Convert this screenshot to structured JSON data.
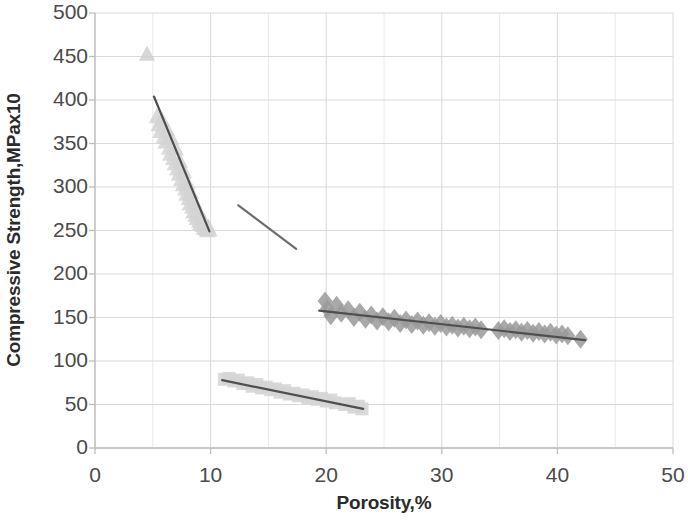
{
  "chart_data": {
    "type": "scatter",
    "title": "",
    "xlabel": "Porosity,%",
    "ylabel": "Compressive Strength,MPax10",
    "xlim": [
      0,
      50
    ],
    "ylim": [
      0,
      500
    ],
    "xticks": [
      "0",
      "10",
      "20",
      "30",
      "40",
      "50"
    ],
    "yticks": [
      "500",
      "450",
      "400",
      "350",
      "300",
      "250",
      "200",
      "150",
      "100",
      "50",
      "0"
    ],
    "xtick_values": [
      0,
      10,
      20,
      30,
      40,
      50
    ],
    "ytick_values": [
      500,
      450,
      400,
      350,
      300,
      250,
      200,
      150,
      100,
      50,
      0
    ],
    "grid": true,
    "minor_grid_x_step": 5,
    "legend": "none",
    "colors": {
      "marker_light": "#d2d2d2",
      "marker_mid": "#9a9a9a",
      "trendline_dark": "#4f4f4f",
      "trendline_mid": "#6e6e6e",
      "gridline": "#d9d9d9",
      "minor_gridline": "#eaeaea",
      "axis": "#bdbdbd",
      "tick_text": "#4a4a4a",
      "title_text": "#2b2b2b"
    },
    "series": [
      {
        "name": "isolated-triangle-point",
        "marker": "triangle",
        "color": "#cfcfcf",
        "points": [
          [
            4.5,
            453
          ]
        ]
      },
      {
        "name": "triangles-high-strength",
        "marker": "triangle",
        "color": "#d4d4d4",
        "trendline": {
          "x0": 5.1,
          "y0": 404,
          "x1": 9.9,
          "y1": 249,
          "color": "#4f4f4f"
        },
        "points": [
          [
            5.35,
            381
          ],
          [
            5.5,
            372
          ],
          [
            5.65,
            364
          ],
          [
            5.8,
            377
          ],
          [
            5.95,
            358
          ],
          [
            6.1,
            352
          ],
          [
            6.25,
            366
          ],
          [
            6.4,
            345
          ],
          [
            6.5,
            338
          ],
          [
            6.6,
            356
          ],
          [
            6.75,
            333
          ],
          [
            6.9,
            327
          ],
          [
            7.0,
            344
          ],
          [
            7.1,
            321
          ],
          [
            7.25,
            315
          ],
          [
            7.35,
            330
          ],
          [
            7.45,
            309
          ],
          [
            7.6,
            303
          ],
          [
            7.7,
            318
          ],
          [
            7.8,
            298
          ],
          [
            7.9,
            292
          ],
          [
            8.0,
            305
          ],
          [
            8.1,
            287
          ],
          [
            8.2,
            281
          ],
          [
            8.3,
            294
          ],
          [
            8.4,
            277
          ],
          [
            8.5,
            272
          ],
          [
            8.6,
            283
          ],
          [
            8.7,
            268
          ],
          [
            8.8,
            264
          ],
          [
            8.9,
            274
          ],
          [
            9.0,
            261
          ],
          [
            9.1,
            258
          ],
          [
            9.2,
            266
          ],
          [
            9.3,
            256
          ],
          [
            9.4,
            253
          ],
          [
            9.5,
            259
          ],
          [
            9.6,
            252
          ],
          [
            9.7,
            250
          ],
          [
            9.8,
            254
          ],
          [
            9.9,
            251
          ]
        ]
      },
      {
        "name": "orphan-trendline-segment",
        "marker": "none",
        "color": "#6e6e6e",
        "trendline": {
          "x0": 12.4,
          "y0": 279,
          "x1": 17.4,
          "y1": 229,
          "color": "#6e6e6e"
        },
        "points": []
      },
      {
        "name": "squares-low-strength",
        "marker": "square",
        "color": "#d5d5d5",
        "trendline": {
          "x0": 11.0,
          "y0": 78,
          "x1": 23.2,
          "y1": 45,
          "color": "#4f4f4f"
        },
        "points": [
          [
            11.2,
            79
          ],
          [
            11.6,
            80
          ],
          [
            12.0,
            77
          ],
          [
            12.4,
            78
          ],
          [
            12.8,
            74
          ],
          [
            13.2,
            75
          ],
          [
            13.6,
            71
          ],
          [
            14.0,
            73
          ],
          [
            14.4,
            69
          ],
          [
            14.8,
            70
          ],
          [
            15.2,
            67
          ],
          [
            15.6,
            68
          ],
          [
            16.0,
            64
          ],
          [
            16.4,
            66
          ],
          [
            16.8,
            62
          ],
          [
            17.2,
            63
          ],
          [
            17.6,
            60
          ],
          [
            18.0,
            61
          ],
          [
            18.4,
            58
          ],
          [
            18.8,
            59
          ],
          [
            19.2,
            56
          ],
          [
            19.6,
            57
          ],
          [
            20.0,
            54
          ],
          [
            20.4,
            55
          ],
          [
            20.8,
            52
          ],
          [
            21.6,
            50
          ],
          [
            22.0,
            51
          ],
          [
            22.4,
            47
          ],
          [
            22.8,
            48
          ],
          [
            23.1,
            45
          ]
        ]
      },
      {
        "name": "diamonds-mid-strength",
        "marker": "diamond",
        "color": "#9a9a9a",
        "trendline": {
          "x0": 19.4,
          "y0": 158,
          "x1": 42.4,
          "y1": 124,
          "color": "#4f4f4f"
        },
        "points": [
          [
            19.9,
            169
          ],
          [
            20.1,
            160
          ],
          [
            20.4,
            152
          ],
          [
            20.9,
            164
          ],
          [
            21.3,
            155
          ],
          [
            21.9,
            159
          ],
          [
            22.4,
            150
          ],
          [
            22.9,
            156
          ],
          [
            23.4,
            148
          ],
          [
            23.9,
            153
          ],
          [
            24.4,
            146
          ],
          [
            24.9,
            151
          ],
          [
            25.4,
            145
          ],
          [
            25.9,
            149
          ],
          [
            26.4,
            143
          ],
          [
            26.9,
            147
          ],
          [
            27.4,
            142
          ],
          [
            27.9,
            146
          ],
          [
            28.4,
            141
          ],
          [
            28.9,
            144
          ],
          [
            29.4,
            140
          ],
          [
            29.9,
            143
          ],
          [
            30.4,
            139
          ],
          [
            30.9,
            141
          ],
          [
            31.4,
            138
          ],
          [
            31.9,
            140
          ],
          [
            32.4,
            137
          ],
          [
            32.9,
            139
          ],
          [
            33.4,
            136
          ],
          [
            34.9,
            135
          ],
          [
            35.4,
            137
          ],
          [
            35.9,
            134
          ],
          [
            36.4,
            136
          ],
          [
            36.9,
            133
          ],
          [
            37.4,
            135
          ],
          [
            37.9,
            132
          ],
          [
            38.4,
            134
          ],
          [
            38.9,
            131
          ],
          [
            39.4,
            133
          ],
          [
            39.9,
            130
          ],
          [
            40.4,
            131
          ],
          [
            40.9,
            129
          ],
          [
            42.0,
            125
          ]
        ]
      }
    ]
  },
  "axes": {
    "y_title": "Compressive Strength,MPax10",
    "x_title": "Porosity,%"
  }
}
